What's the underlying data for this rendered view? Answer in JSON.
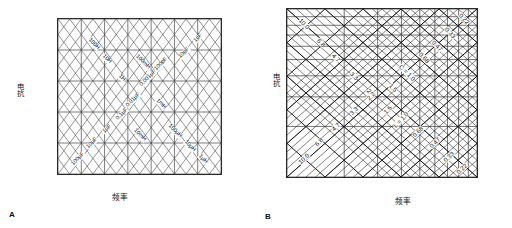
{
  "figure": {
    "panel_a_letter": "A",
    "panel_b_letter": "B"
  },
  "chart_data": [
    {
      "id": "A",
      "type": "line",
      "title": "",
      "xlabel": "频率",
      "ylabel": "电抗",
      "grid": true,
      "xscale": "log",
      "yscale": "log",
      "xticks": [
        "10 Hz",
        "100 Hz",
        "1 kHz",
        "10 kHz",
        "100 kHz",
        "1 MHz",
        "10 MHz",
        "100 MHz"
      ],
      "yticks": [
        "1 MΩ",
        "100 kΩ",
        "10 kΩ",
        "1 kΩ",
        "100 Ω",
        "10 Ω"
      ],
      "xlim": [
        10,
        100000000
      ],
      "ylim": [
        10,
        1000000
      ],
      "annotations_inductance": [
        "100H",
        "10H",
        "1H",
        "100mH",
        "10mH",
        "1mH",
        "100µH",
        "10µH",
        "1µH"
      ],
      "annotations_capacitance": [
        "100µF",
        "10µF",
        "1µF",
        "0.1µF",
        "0.01µF",
        "0.001µF",
        "100pF",
        "10pF",
        "1pF"
      ]
    },
    {
      "id": "B",
      "type": "line",
      "title": "",
      "xlabel": "频率",
      "ylabel": "电抗",
      "grid": true,
      "xscale": "log",
      "yscale": "log",
      "xticks": [
        "1",
        "2",
        "3",
        "4",
        "5",
        "6",
        "7",
        "8",
        "9",
        "10"
      ],
      "yticks": [
        "10",
        "9",
        "8",
        "7",
        "6",
        "5",
        "4",
        "3",
        "2",
        "1"
      ],
      "xlim": [
        1,
        10
      ],
      "ylim": [
        1,
        10
      ],
      "series_capacitance_label": "C = 1.0",
      "series_inductance_label": "L = 1.0",
      "annotations_upper_left": [
        "10.0",
        "6.8",
        "4.7",
        "3.3",
        "2.2",
        "1.5"
      ],
      "annotations_upper_right": [
        "1.5",
        "0.68",
        "0.47",
        "0.33",
        "0.22"
      ],
      "annotations_lower_left": [
        "10.0",
        "6.8",
        "4.7",
        "3.3",
        "2.2",
        "1.5"
      ],
      "annotations_lower_right": [
        "0.68",
        "0.47",
        "0.33",
        "0.22"
      ]
    }
  ],
  "panel_a": {
    "yticks": [
      {
        "label": "1 MΩ",
        "pos": 0
      },
      {
        "label": "100 kΩ",
        "pos": 20
      },
      {
        "label": "10 kΩ",
        "pos": 40
      },
      {
        "label": "1 kΩ",
        "pos": 60
      },
      {
        "label": "100 Ω",
        "pos": 80
      },
      {
        "label": "10 Ω",
        "pos": 100
      }
    ],
    "xticks": [
      {
        "label": "10 Hz",
        "pos": 0
      },
      {
        "label": "100 Hz",
        "pos": 14.2857
      },
      {
        "label": "1 kHz",
        "pos": 28.5714
      },
      {
        "label": "10 kHz",
        "pos": 42.857
      },
      {
        "label": "100 kHz",
        "pos": 57.142
      },
      {
        "label": "1 MHz",
        "pos": 71.428
      },
      {
        "label": "10 MHz",
        "pos": 85.714
      },
      {
        "label": "100 MHz",
        "pos": 100
      }
    ],
    "ylabel": "电抗",
    "xlabel": "频率",
    "inductance_labels": [
      {
        "text": "100H",
        "x": 22,
        "y": 16
      },
      {
        "text": "10H",
        "x": 30,
        "y": 26
      },
      {
        "text": "1H",
        "x": 39,
        "y": 38
      },
      {
        "text": "100mH",
        "x": 52,
        "y": 28
      },
      {
        "text": "10mH",
        "x": 50,
        "y": 75
      },
      {
        "text": "1mH",
        "x": 63,
        "y": 55
      },
      {
        "text": "100µH",
        "x": 72,
        "y": 72
      },
      {
        "text": "10µH",
        "x": 81,
        "y": 82
      },
      {
        "text": "1µH",
        "x": 89,
        "y": 90
      }
    ],
    "capacitance_labels": [
      {
        "text": "100µF",
        "x": 12,
        "y": 90
      },
      {
        "text": "10µF",
        "x": 21,
        "y": 80
      },
      {
        "text": "1µF",
        "x": 30,
        "y": 71
      },
      {
        "text": "0.1µF",
        "x": 39,
        "y": 61
      },
      {
        "text": "0.01µF",
        "x": 46,
        "y": 52
      },
      {
        "text": "0.001µF",
        "x": 55,
        "y": 38
      },
      {
        "text": "100pF",
        "x": 63,
        "y": 29
      },
      {
        "text": "10pF",
        "x": 77,
        "y": 22
      },
      {
        "text": "1pF",
        "x": 86,
        "y": 12
      }
    ]
  },
  "panel_b": {
    "yticks": [
      {
        "label": "10",
        "pos": 0
      },
      {
        "label": "9",
        "pos": 4.58
      },
      {
        "label": "8",
        "pos": 9.69
      },
      {
        "label": "7",
        "pos": 15.49
      },
      {
        "label": "6",
        "pos": 22.18
      },
      {
        "label": "5",
        "pos": 30.1
      },
      {
        "label": "4",
        "pos": 39.79
      },
      {
        "label": "3",
        "pos": 52.29
      },
      {
        "label": "2",
        "pos": 69.9
      },
      {
        "label": "1",
        "pos": 100
      }
    ],
    "xticks": [
      {
        "label": "1",
        "pos": 0
      },
      {
        "label": "2",
        "pos": 30.1
      },
      {
        "label": "3",
        "pos": 47.71
      },
      {
        "label": "4",
        "pos": 60.21
      },
      {
        "label": "5",
        "pos": 69.9
      },
      {
        "label": "6",
        "pos": 77.82
      },
      {
        "label": "7",
        "pos": 84.51
      },
      {
        "label": "8",
        "pos": 90.31
      },
      {
        "label": "9",
        "pos": 95.42
      },
      {
        "label": "10",
        "pos": 100
      }
    ],
    "ylabel": "电抗",
    "xlabel": "频率",
    "cap_labels": [
      {
        "text": "10.0",
        "x": 9,
        "y": 9
      },
      {
        "text": "6.8",
        "x": 18,
        "y": 20
      },
      {
        "text": "4.7",
        "x": 26,
        "y": 29
      },
      {
        "text": "3.3",
        "x": 35,
        "y": 40
      },
      {
        "text": "2.2",
        "x": 44,
        "y": 50
      },
      {
        "text": "1.5",
        "x": 56,
        "y": 47
      },
      {
        "text": "C = 1.0",
        "x": 63,
        "y": 38
      },
      {
        "text": "0.68",
        "x": 72,
        "y": 29
      },
      {
        "text": "0.47",
        "x": 79,
        "y": 22
      },
      {
        "text": "0.33",
        "x": 86,
        "y": 14
      },
      {
        "text": "0.22",
        "x": 93,
        "y": 6
      }
    ],
    "ind_labels": [
      {
        "text": "10.0",
        "x": 9,
        "y": 89
      },
      {
        "text": "6.8",
        "x": 17,
        "y": 79
      },
      {
        "text": "4.7",
        "x": 26,
        "y": 70
      },
      {
        "text": "3.3",
        "x": 35,
        "y": 61
      },
      {
        "text": "2.2",
        "x": 44,
        "y": 52
      },
      {
        "text": "1.5",
        "x": 53,
        "y": 60
      },
      {
        "text": "L = 1.0",
        "x": 60,
        "y": 66
      },
      {
        "text": "0.68",
        "x": 69,
        "y": 73
      },
      {
        "text": "0.47",
        "x": 78,
        "y": 80
      },
      {
        "text": "0.33",
        "x": 85,
        "y": 88
      },
      {
        "text": "0.22",
        "x": 92,
        "y": 95
      }
    ]
  }
}
